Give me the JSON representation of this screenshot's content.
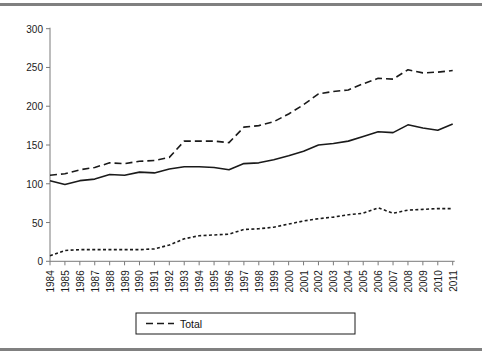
{
  "figure": {
    "top_rule_color": "#808080",
    "bottom_rule_color": "#808080"
  },
  "chart_data": {
    "type": "line",
    "title": "",
    "subtitle": "",
    "xlabel": "",
    "ylabel": "",
    "grid": false,
    "legend_position": "bottom",
    "xlim": [
      1984,
      2011
    ],
    "ylim": [
      0,
      300
    ],
    "ytick_labels": [
      "0",
      "50",
      "100",
      "150",
      "200",
      "250",
      "300"
    ],
    "yticks": [
      0,
      50,
      100,
      150,
      200,
      250,
      300
    ],
    "categories": [
      "1984",
      "1985",
      "1986",
      "1987",
      "1988",
      "1989",
      "1990",
      "1991",
      "1992",
      "1993",
      "1994",
      "1995",
      "1996",
      "1997",
      "1998",
      "1999",
      "2000",
      "2001",
      "2002",
      "2003",
      "2004",
      "2005",
      "2006",
      "2007",
      "2008",
      "2009",
      "2010",
      "2011"
    ],
    "series": [
      {
        "name": "Total",
        "style": "long-dash",
        "color": "#1a1a1a",
        "values": [
          111,
          113,
          118,
          121,
          127,
          126,
          129,
          130,
          134,
          155,
          155,
          155,
          153,
          173,
          175,
          180,
          190,
          202,
          216,
          219,
          221,
          229,
          236,
          235,
          247,
          243,
          244,
          246
        ]
      },
      {
        "name": "Men",
        "style": "solid",
        "color": "#1a1a1a",
        "values": [
          104,
          99,
          104,
          106,
          112,
          111,
          115,
          114,
          119,
          122,
          122,
          121,
          118,
          126,
          127,
          131,
          136,
          142,
          150,
          152,
          155,
          161,
          167,
          166,
          176,
          172,
          169,
          177
        ]
      },
      {
        "name": "Women",
        "style": "fine-dash",
        "color": "#1a1a1a",
        "values": [
          7,
          14,
          15,
          15,
          15,
          15,
          15,
          16,
          21,
          29,
          33,
          34,
          35,
          41,
          42,
          44,
          48,
          52,
          55,
          57,
          60,
          62,
          69,
          62,
          66,
          67,
          68,
          68
        ]
      }
    ]
  },
  "legend": {
    "entries": [
      {
        "label": "Total",
        "style": "long-dash"
      },
      {
        "label": "Men",
        "style": "solid"
      },
      {
        "label": "Women",
        "style": "fine-dash"
      }
    ]
  }
}
